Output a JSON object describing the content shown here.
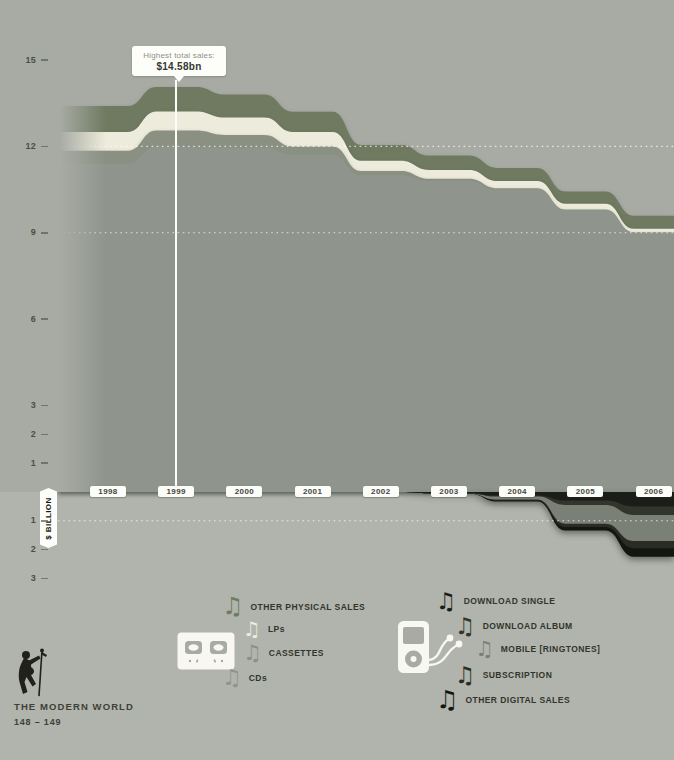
{
  "colors": {
    "bg_above": "#a8aba4",
    "bg_below": "#b1b4ac",
    "annotation_line": "#fdfdfa",
    "label_chip": "#fcfcf8",
    "tick_text": "#4c4e45",
    "legend_text": "#32342d"
  },
  "icons": {
    "music_note_glyph": "♫",
    "physical_group_icon": "cassette-icon",
    "digital_group_icon": "music-player-earbuds-icon",
    "footer_icon": "dancing-singer-icon"
  },
  "annotation": {
    "line1": "Highest total sales:",
    "line2": "$14.58bn",
    "year": 1999
  },
  "footer": {
    "series_title": "THE MODERN WORLD",
    "pages": "148 – 149"
  },
  "chart_data": {
    "type": "area",
    "stacked": true,
    "x": [
      1998,
      1999,
      2000,
      2001,
      2002,
      2003,
      2004,
      2005,
      2006
    ],
    "xlabel": "",
    "ylabel": "$ BILLION",
    "ylim": [
      -3,
      15
    ],
    "yticks_above": [
      15,
      12,
      9,
      6,
      3,
      2,
      1
    ],
    "yticks_below": [
      1,
      2,
      3
    ],
    "dotted_gridlines": [
      12,
      9,
      -1
    ],
    "grid": "dotted-white",
    "legend_position": "bottom",
    "physical_series": [
      {
        "name": "OTHER PHYSICAL SALES",
        "color": "#6f7a61",
        "values": [
          0.9,
          0.85,
          0.8,
          0.7,
          0.55,
          0.5,
          0.45,
          0.42,
          0.45
        ]
      },
      {
        "name": "LPs",
        "color": "#edebdb",
        "values": [
          0.65,
          0.66,
          0.6,
          0.5,
          0.35,
          0.3,
          0.25,
          0.2,
          0.12
        ]
      },
      {
        "name": "CASSETTES",
        "color": "#8a9082",
        "values": [
          0.45,
          0.55,
          0.45,
          0.3,
          0.15,
          0.08,
          0.05,
          0.03,
          0.02
        ]
      },
      {
        "name": "CDs",
        "color": "#8f958d",
        "values": [
          11.4,
          12.0,
          11.95,
          11.7,
          11.0,
          10.8,
          10.5,
          9.78,
          9.0
        ]
      }
    ],
    "digital_series": [
      {
        "name": "DOWNLOAD SINGLE",
        "color": "#1b1d18",
        "values": [
          0,
          0,
          0,
          0,
          0,
          0.05,
          0.12,
          0.3,
          0.5
        ]
      },
      {
        "name": "DOWNLOAD ALBUM",
        "color": "#33342c",
        "values": [
          0,
          0,
          0,
          0,
          0,
          0,
          0.04,
          0.15,
          0.3
        ]
      },
      {
        "name": "MOBILE [RINGTONES]",
        "color": "#7b8076",
        "values": [
          0,
          0,
          0,
          0,
          0,
          0,
          0.1,
          0.65,
          0.9
        ]
      },
      {
        "name": "SUBSCRIPTION",
        "color": "#2a2c24",
        "values": [
          0,
          0,
          0,
          0,
          0,
          0,
          0.03,
          0.12,
          0.25
        ]
      },
      {
        "name": "OTHER DIGITAL SALES",
        "color": "#13150f",
        "values": [
          0,
          0,
          0,
          0,
          0,
          0,
          0.04,
          0.12,
          0.3
        ]
      }
    ],
    "annotation": {
      "label": "Highest total sales:",
      "value": "$14.58bn",
      "year": 1999
    }
  }
}
